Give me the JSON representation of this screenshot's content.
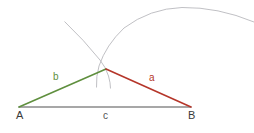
{
  "figure": {
    "background": "#ffffff",
    "width": 254,
    "height": 133,
    "colors": {
      "side_a": "#b5362a",
      "side_b": "#5f8f3e",
      "side_c": "#8a8a8a",
      "arc": "#b9b9bd",
      "vertex_text": "#3a3a3a"
    },
    "vertices": {
      "A": {
        "label": "A",
        "x": 19,
        "y": 107,
        "label_x": 16,
        "label_y": 110
      },
      "B": {
        "label": "B",
        "x": 191,
        "y": 107,
        "label_x": 188,
        "label_y": 110
      },
      "C": {
        "label": "",
        "x": 106,
        "y": 69
      }
    },
    "sides": [
      {
        "name": "a",
        "label": "a",
        "color": "#b5362a",
        "from": "C",
        "to": "B",
        "label_x": 149,
        "label_y": 73
      },
      {
        "name": "b",
        "label": "b",
        "color": "#5f8f3e",
        "from": "A",
        "to": "C",
        "label_x": 53,
        "label_y": 72
      },
      {
        "name": "c",
        "label": "c",
        "color": "#8a8a8a",
        "from": "A",
        "to": "B",
        "label_x": 103,
        "label_y": 111
      }
    ],
    "arcs": [
      {
        "name": "arc-centered-at-A",
        "center": "A",
        "radius": 98,
        "color": "#b9b9bd"
      },
      {
        "name": "arc-centered-at-B",
        "center": "B",
        "radius": 95,
        "color": "#b9b9bd"
      }
    ]
  }
}
